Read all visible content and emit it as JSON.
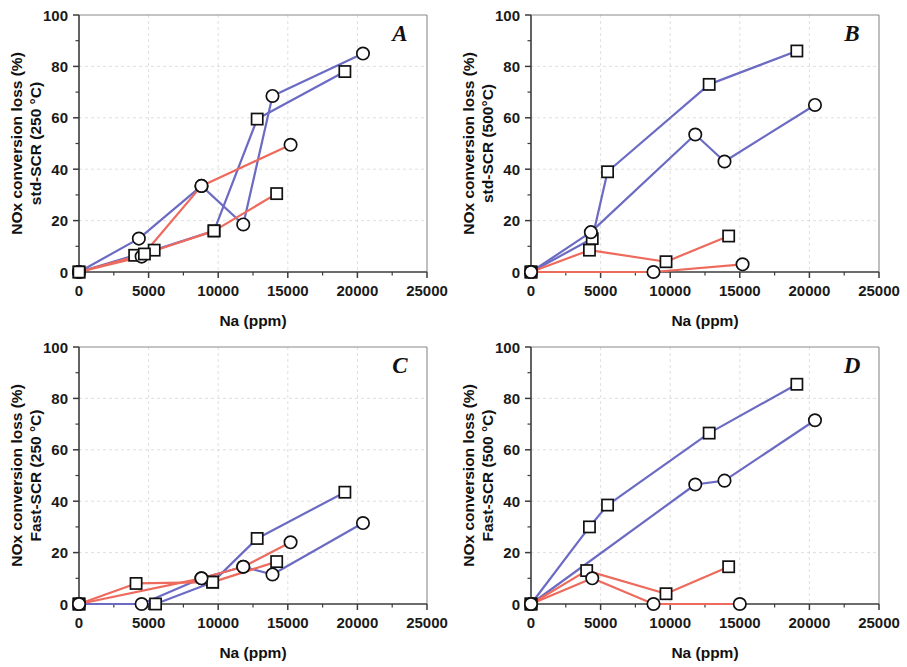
{
  "figure": {
    "width": 907,
    "height": 667,
    "background": "#ffffff",
    "panel_count": 4
  },
  "colors": {
    "blue": "#6b6bc4",
    "red": "#ee6a5c",
    "marker_edge": "#111111",
    "marker_fill": "#ffffff",
    "axis": "#3b3b3b",
    "grid": "#d8d8d8"
  },
  "axis_common": {
    "xlabel": "Na (ppm)",
    "xlim": [
      0,
      25000
    ],
    "ylim": [
      0,
      100
    ],
    "xticks": [
      0,
      5000,
      10000,
      15000,
      20000,
      25000
    ],
    "xticklabels": [
      "0",
      "5000",
      "10000",
      "15000",
      "20000",
      "25000"
    ],
    "yticks": [
      0,
      20,
      40,
      60,
      80,
      100
    ],
    "yticklabels": [
      "0",
      "20",
      "40",
      "60",
      "80",
      "100"
    ],
    "ylabel_line1": "NOx conversion loss (%)",
    "grid": true,
    "legend": "none"
  },
  "chart_data": [
    {
      "id": "A",
      "type": "line",
      "panel_letter": "A",
      "title": "",
      "xlabel": "Na (ppm)",
      "ylabel": "NOx conversion loss (%) std-SCR (250 °C)",
      "ylabel_line1": "NOx conversion loss (%)",
      "ylabel_line2": "std-SCR (250 °C)",
      "xlim": [
        0,
        25000
      ],
      "ylim": [
        0,
        100
      ],
      "xticks": [
        0,
        5000,
        10000,
        15000,
        20000,
        25000
      ],
      "yticks": [
        0,
        20,
        40,
        60,
        80,
        100
      ],
      "series": [
        {
          "name": "blue-circle",
          "color": "#6b6bc4",
          "marker": "circle",
          "x": [
            0,
            4300,
            8800,
            11800,
            13900,
            20400
          ],
          "y": [
            0,
            13.0,
            33.5,
            18.5,
            68.5,
            85.0
          ]
        },
        {
          "name": "blue-square",
          "color": "#6b6bc4",
          "marker": "square",
          "x": [
            0,
            4000,
            5400,
            9700,
            12800,
            19100
          ],
          "y": [
            0,
            6.5,
            8.5,
            16.0,
            59.5,
            78.0
          ]
        },
        {
          "name": "red-circle",
          "color": "#ee6a5c",
          "marker": "circle",
          "x": [
            0,
            4500,
            8800,
            15200
          ],
          "y": [
            0,
            6.0,
            33.5,
            49.5
          ]
        },
        {
          "name": "red-square",
          "color": "#ee6a5c",
          "marker": "square",
          "x": [
            0,
            4700,
            9700,
            14200
          ],
          "y": [
            0,
            7.0,
            16.0,
            30.5
          ]
        }
      ]
    },
    {
      "id": "B",
      "type": "line",
      "panel_letter": "B",
      "title": "",
      "xlabel": "Na (ppm)",
      "ylabel": "NOx conversion loss (%) std-SCR (500°C)",
      "ylabel_line1": "NOx conversion loss (%)",
      "ylabel_line2": "std-SCR (500°C)",
      "xlim": [
        0,
        25000
      ],
      "ylim": [
        0,
        100
      ],
      "xticks": [
        0,
        5000,
        10000,
        15000,
        20000,
        25000
      ],
      "yticks": [
        0,
        20,
        40,
        60,
        80,
        100
      ],
      "series": [
        {
          "name": "blue-square",
          "color": "#6b6bc4",
          "marker": "square",
          "x": [
            0,
            4400,
            5500,
            12800,
            19100
          ],
          "y": [
            0,
            13.0,
            39.0,
            73.0,
            86.0
          ]
        },
        {
          "name": "blue-circle",
          "color": "#6b6bc4",
          "marker": "circle",
          "x": [
            0,
            4300,
            11800,
            13900,
            20400
          ],
          "y": [
            0,
            15.5,
            53.5,
            43.0,
            65.0
          ]
        },
        {
          "name": "red-square",
          "color": "#ee6a5c",
          "marker": "square",
          "x": [
            0,
            4200,
            9700,
            14200
          ],
          "y": [
            0,
            8.5,
            4.0,
            14.0
          ]
        },
        {
          "name": "red-circle",
          "color": "#ee6a5c",
          "marker": "circle",
          "x": [
            0,
            8800,
            15200
          ],
          "y": [
            0,
            0.0,
            3.0
          ]
        }
      ]
    },
    {
      "id": "C",
      "type": "line",
      "panel_letter": "C",
      "title": "",
      "xlabel": "Na (ppm)",
      "ylabel": "NOx conversion loss (%) Fast-SCR (250 °C)",
      "ylabel_line1": "NOx conversion loss (%)",
      "ylabel_line2": "Fast-SCR (250 °C)",
      "xlim": [
        0,
        25000
      ],
      "ylim": [
        0,
        100
      ],
      "xticks": [
        0,
        5000,
        10000,
        15000,
        20000,
        25000
      ],
      "yticks": [
        0,
        20,
        40,
        60,
        80,
        100
      ],
      "series": [
        {
          "name": "blue-square",
          "color": "#6b6bc4",
          "marker": "square",
          "x": [
            0,
            5500,
            9600,
            12800,
            19100
          ],
          "y": [
            0,
            0.0,
            8.5,
            25.5,
            43.5
          ]
        },
        {
          "name": "blue-circle",
          "color": "#6b6bc4",
          "marker": "circle",
          "x": [
            0,
            4500,
            8800,
            11800,
            13900,
            20400
          ],
          "y": [
            0,
            0.0,
            10.0,
            14.5,
            11.5,
            31.5
          ]
        },
        {
          "name": "red-square",
          "color": "#ee6a5c",
          "marker": "square",
          "x": [
            0,
            4100,
            9600,
            14200
          ],
          "y": [
            0,
            8.0,
            8.5,
            16.5
          ]
        },
        {
          "name": "red-circle",
          "color": "#ee6a5c",
          "marker": "circle",
          "x": [
            0,
            8800,
            11800,
            15200
          ],
          "y": [
            0,
            10.0,
            14.5,
            24.0
          ]
        }
      ]
    },
    {
      "id": "D",
      "type": "line",
      "panel_letter": "D",
      "title": "",
      "xlabel": "Na (ppm)",
      "ylabel": "NOx conversion loss (%) Fast-SCR (500 °C)",
      "ylabel_line1": "NOx conversion loss (%)",
      "ylabel_line2": "Fast-SCR (500 °C)",
      "xlim": [
        0,
        25000
      ],
      "ylim": [
        0,
        100
      ],
      "xticks": [
        0,
        5000,
        10000,
        15000,
        20000,
        25000
      ],
      "yticks": [
        0,
        20,
        40,
        60,
        80,
        100
      ],
      "series": [
        {
          "name": "blue-square",
          "color": "#6b6bc4",
          "marker": "square",
          "x": [
            0,
            4200,
            5500,
            12800,
            19100
          ],
          "y": [
            0,
            30.0,
            38.5,
            66.5,
            85.5
          ]
        },
        {
          "name": "blue-circle",
          "color": "#6b6bc4",
          "marker": "circle",
          "x": [
            0,
            11800,
            13900,
            20400
          ],
          "y": [
            0,
            46.5,
            48.0,
            71.5
          ]
        },
        {
          "name": "red-square",
          "color": "#ee6a5c",
          "marker": "square",
          "x": [
            0,
            4000,
            9700,
            14200
          ],
          "y": [
            0,
            13.0,
            4.0,
            14.5
          ]
        },
        {
          "name": "red-circle",
          "color": "#ee6a5c",
          "marker": "circle",
          "x": [
            0,
            4400,
            8800,
            15000
          ],
          "y": [
            0,
            10.0,
            0.0,
            0.0
          ]
        }
      ]
    }
  ]
}
